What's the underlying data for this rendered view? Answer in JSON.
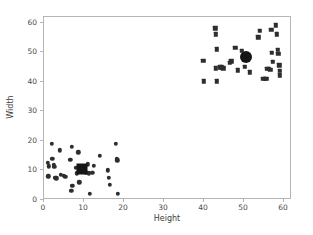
{
  "chart_data": {
    "type": "scatter",
    "title": "",
    "xlabel": "Height",
    "ylabel": "Width",
    "xlim": [
      0,
      62
    ],
    "ylim": [
      0,
      62
    ],
    "xticks": [
      0,
      10,
      20,
      30,
      40,
      50,
      60
    ],
    "yticks": [
      0,
      10,
      20,
      30,
      40,
      50,
      60
    ],
    "xticklabels": [
      "0",
      "10",
      "20",
      "30",
      "40",
      "50",
      "60"
    ],
    "yticklabels": [
      "0",
      "10",
      "20",
      "30",
      "40",
      "50",
      "60"
    ],
    "grid": false,
    "legend": null,
    "marker_color": "#2e2e2e",
    "centroid_color": "#151515",
    "series": [
      {
        "name": "cluster-1",
        "marker": "circle",
        "points": [
          [
            1.0,
            12.6
          ],
          [
            1.2,
            11.4
          ],
          [
            1.1,
            8.0
          ],
          [
            2.0,
            19.1
          ],
          [
            2.1,
            14.0
          ],
          [
            2.4,
            12.0
          ],
          [
            2.6,
            11.2
          ],
          [
            2.8,
            7.6
          ],
          [
            3.1,
            7.4
          ],
          [
            4.0,
            16.9
          ],
          [
            4.2,
            8.6
          ],
          [
            5.0,
            8.2
          ],
          [
            5.3,
            7.8
          ],
          [
            6.6,
            13.6
          ],
          [
            6.8,
            3.2
          ],
          [
            7.0,
            18.0
          ],
          [
            7.1,
            4.9
          ],
          [
            8.0,
            10.9
          ],
          [
            8.2,
            9.1
          ],
          [
            8.6,
            16.2
          ],
          [
            8.8,
            6.0
          ],
          [
            9.6,
            10.4
          ],
          [
            10.0,
            11.0
          ],
          [
            10.4,
            9.4
          ],
          [
            11.0,
            12.1
          ],
          [
            11.2,
            9.0
          ],
          [
            11.4,
            2.2
          ],
          [
            12.1,
            9.2
          ],
          [
            12.4,
            11.6
          ],
          [
            14.0,
            15.0
          ],
          [
            16.0,
            10.1
          ],
          [
            16.2,
            7.6
          ],
          [
            16.4,
            5.2
          ],
          [
            18.0,
            19.1
          ],
          [
            18.2,
            14.0
          ],
          [
            18.3,
            13.5
          ],
          [
            18.4,
            2.2
          ]
        ]
      },
      {
        "name": "cluster-2",
        "marker": "square",
        "points": [
          [
            39.8,
            47.2
          ],
          [
            39.9,
            40.2
          ],
          [
            42.8,
            58.2
          ],
          [
            43.0,
            56.2
          ],
          [
            43.2,
            51.0
          ],
          [
            43.0,
            44.6
          ],
          [
            43.2,
            40.2
          ],
          [
            44.0,
            45.0
          ],
          [
            44.4,
            45.0
          ],
          [
            44.8,
            44.6
          ],
          [
            46.4,
            46.5
          ],
          [
            46.8,
            47.0
          ],
          [
            47.8,
            51.6
          ],
          [
            48.4,
            44.0
          ],
          [
            49.4,
            50.6
          ],
          [
            50.2,
            45.2
          ],
          [
            51.4,
            43.2
          ],
          [
            53.6,
            55.1
          ],
          [
            54.0,
            57.4
          ],
          [
            54.8,
            41.0
          ],
          [
            55.2,
            41.0
          ],
          [
            55.6,
            41.0
          ],
          [
            55.8,
            44.4
          ],
          [
            56.2,
            44.4
          ],
          [
            56.6,
            44.2
          ],
          [
            56.8,
            57.6
          ],
          [
            57.0,
            49.8
          ],
          [
            57.2,
            46.8
          ],
          [
            58.0,
            59.2
          ],
          [
            58.2,
            56.2
          ],
          [
            58.4,
            50.8
          ],
          [
            58.6,
            49.6
          ],
          [
            58.8,
            45.6
          ],
          [
            59.0,
            43.8
          ],
          [
            59.0,
            42.2
          ]
        ]
      }
    ],
    "centroids": [
      {
        "name": "centroid-cluster-1",
        "marker": "square",
        "x": 9.5,
        "y": 10.5
      },
      {
        "name": "centroid-cluster-2",
        "marker": "circle",
        "x": 50.6,
        "y": 48.4
      }
    ]
  }
}
